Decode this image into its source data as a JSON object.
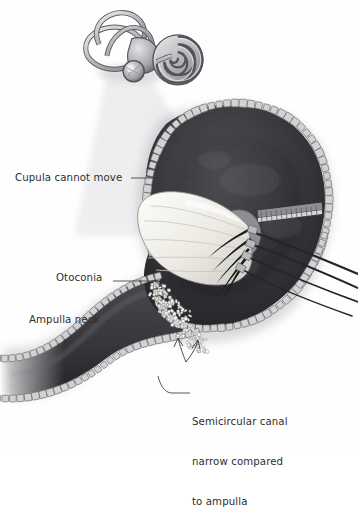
{
  "figure": {
    "background_color": "#fefefe",
    "text_color": "#2e2e30",
    "leader_color": "#3a3a3c"
  },
  "labels": {
    "cupula": "Cupula cannot move",
    "otoconia": "Otoconia",
    "ampulla_neck": "Ampulla neck",
    "semicircular_canal_line1": "Semicircular canal",
    "semicircular_canal_line2": "narrow compared",
    "semicircular_canal_line3": "to ampulla"
  },
  "inset": {
    "name": "inner-ear-labyrinth-inset",
    "description": "grayscale bony labyrinth with cochlea spiral and semicircular canals",
    "parts": [
      "superior-semicircular-canal",
      "posterior-semicircular-canal",
      "horizontal-semicircular-canal",
      "vestibule",
      "cochlea-spiral",
      "ampulla-bulb"
    ],
    "fill_light": "#d8d8da",
    "fill_mid": "#a9a9ad",
    "fill_dark": "#6f6f74",
    "outline": "#4a4a4e"
  },
  "magnifier_cone": {
    "name": "magnification-light-cone",
    "fill": "#e6e6e8",
    "opacity": 0.85
  },
  "anatomy": {
    "ampulla_lumen_fill": "#3c3c40",
    "ampulla_lumen_dark": "#2a2a2e",
    "canal_lumen_fill": "#34343a",
    "epithelium_cell_fill": "#d2d2d2",
    "epithelium_cell_stroke": "#6a6a6e",
    "cupula_fill": "#f2f1ec",
    "cupula_shade": "#d6d5cf",
    "cupula_outline": "#8c8c88",
    "hair_bundle_color": "#1e1e22",
    "crista_fill": "#8e8e92",
    "nerve_fiber_color": "#2b2b30",
    "otoconia_fill": "#fafaf6",
    "otoconia_stroke": "#7f7f80",
    "otoconia_count": 150
  },
  "leaders": [
    {
      "name": "leader-cupula",
      "target": "cupula"
    },
    {
      "name": "leader-otoconia",
      "target": "otoconia-cluster"
    },
    {
      "name": "leader-ampulla-neck",
      "target": "ampulla-neck"
    },
    {
      "name": "leader-semicircular-canal",
      "target": "canal-narrowing",
      "arrow": true
    }
  ]
}
